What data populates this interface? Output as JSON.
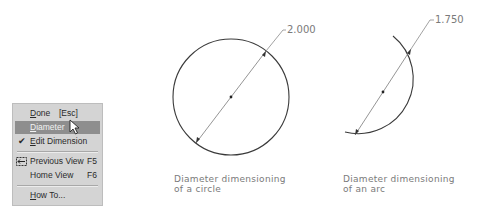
{
  "context_menu": {
    "items": [
      {
        "label": "Done",
        "underline": "D",
        "rest": "one",
        "accel": "[Esc]",
        "highlighted": false,
        "checked": false
      },
      {
        "label": "Diameter",
        "underline": "D",
        "rest": "iameter",
        "accel": "",
        "highlighted": true,
        "checked": false
      },
      {
        "label": "Edit Dimension",
        "underline": "E",
        "rest": "dit Dimension",
        "accel": "",
        "highlighted": false,
        "checked": true
      },
      {
        "label": "Previous View",
        "underline": "",
        "rest": "Previous View",
        "accel": "F5",
        "highlighted": false,
        "icon": "previous-view-icon"
      },
      {
        "label": "Home View",
        "underline": "",
        "rest": "Home View",
        "accel": "F6",
        "highlighted": false
      },
      {
        "label": "How To...",
        "underline": "H",
        "rest": "ow To...",
        "accel": "",
        "highlighted": false
      }
    ],
    "colors": {
      "background": "#d4d4d4",
      "highlight": "#8e8e8e"
    }
  },
  "drawings": {
    "circle": {
      "dimension_value": "2.000",
      "caption_line1": "Diameter dimensioning",
      "caption_line2": "of a circle"
    },
    "arc": {
      "dimension_value": "1.750",
      "caption_line1": "Diameter dimensioning",
      "caption_line2": "of an arc"
    }
  }
}
